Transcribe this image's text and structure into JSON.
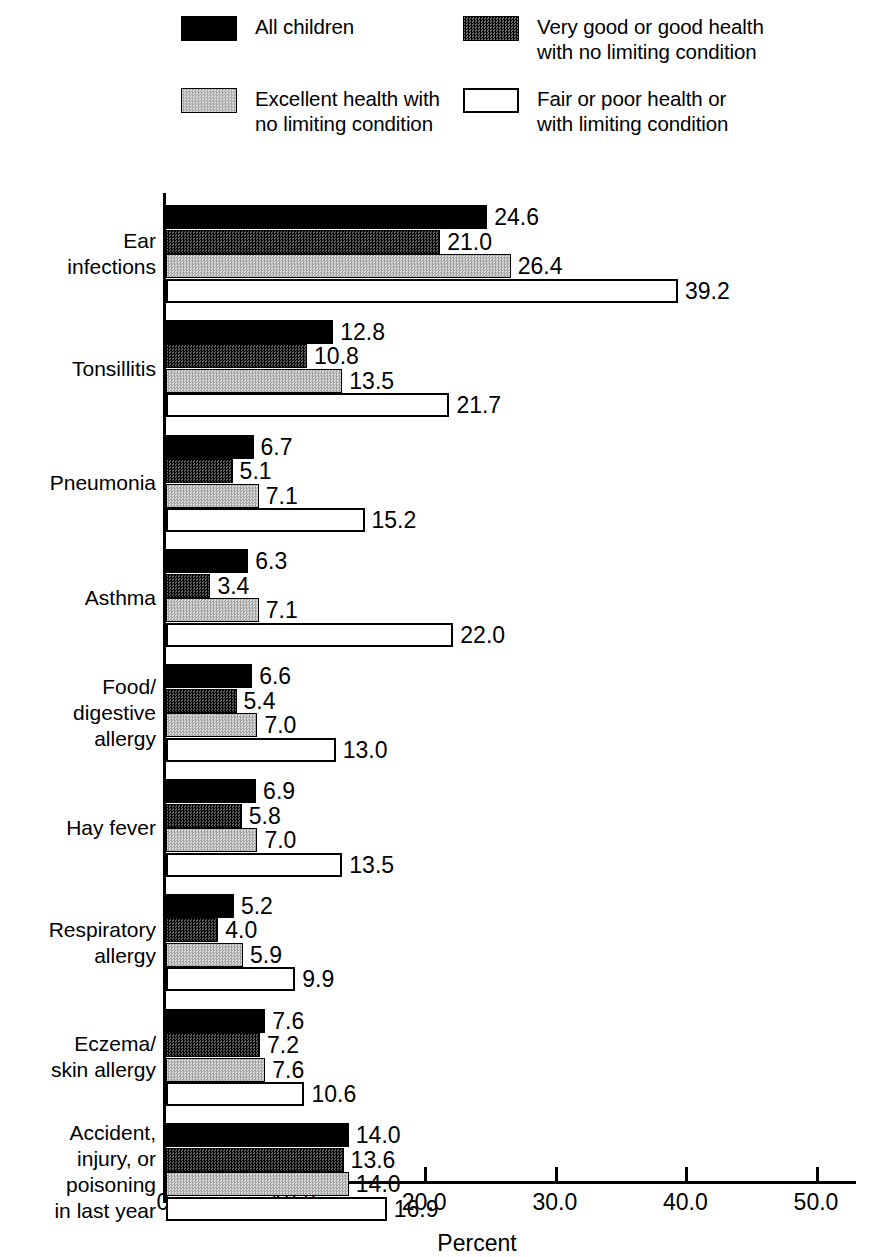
{
  "legend": {
    "items": [
      {
        "label": "All children",
        "swatch": "solid-black-swatch",
        "style": "sw-black",
        "col": "col1",
        "row": "row1"
      },
      {
        "label": "Very good or good health\nwith no limiting condition",
        "swatch": "dark-hatch-swatch",
        "style": "sw-dark",
        "col": "col2",
        "row": "row1"
      },
      {
        "label": "Excellent health with\nno limiting condition",
        "swatch": "light-hatch-swatch",
        "style": "sw-light",
        "col": "col1",
        "row": "row2"
      },
      {
        "label": "Fair or poor health or\nwith limiting condition",
        "swatch": "white-outline-swatch",
        "style": "sw-white",
        "col": "col2",
        "row": "row2"
      }
    ]
  },
  "axis": {
    "tick_labels": [
      "0",
      "10.0",
      "20.0",
      "30.0",
      "40.0",
      "50.0"
    ],
    "tick_values": [
      0,
      10,
      20,
      30,
      40,
      50
    ],
    "xlabel": "Percent"
  },
  "chart_data": {
    "type": "bar",
    "orientation": "horizontal",
    "title": "",
    "xlabel": "Percent",
    "ylabel": "",
    "xlim": [
      0,
      53
    ],
    "grid": false,
    "legend_position": "top",
    "categories": [
      "Ear\ninfections",
      "Tonsillitis",
      "Pneumonia",
      "Asthma",
      "Food/\ndigestive\nallergy",
      "Hay fever",
      "Respiratory\nallergy",
      "Eczema/\nskin allergy",
      "Accident,\ninjury, or\npoisoning\nin last year"
    ],
    "series": [
      {
        "name": "All children",
        "style": "b-black",
        "values": [
          24.6,
          12.8,
          6.7,
          6.3,
          6.6,
          6.9,
          5.2,
          7.6,
          14.0
        ],
        "labels": [
          "24.6",
          "12.8",
          "6.7",
          "6.3",
          "6.6",
          "6.9",
          "5.2",
          "7.6",
          "14.0"
        ]
      },
      {
        "name": "Very good or good health with no limiting condition",
        "style": "b-dark",
        "values": [
          21.0,
          10.8,
          5.1,
          3.4,
          5.4,
          5.8,
          4.0,
          7.2,
          13.6
        ],
        "labels": [
          "21.0",
          "10.8",
          "5.1",
          "3.4",
          "5.4",
          "5.8",
          "4.0",
          "7.2",
          "13.6"
        ]
      },
      {
        "name": "Excellent health with no limiting condition",
        "style": "b-light",
        "values": [
          26.4,
          13.5,
          7.1,
          7.1,
          7.0,
          7.0,
          5.9,
          7.6,
          14.0
        ],
        "labels": [
          "26.4",
          "13.5",
          "7.1",
          "7.1",
          "7.0",
          "7.0",
          "5.9",
          "7.6",
          "14.0"
        ]
      },
      {
        "name": "Fair or poor health or with limiting condition",
        "style": "b-white",
        "values": [
          39.2,
          21.7,
          15.2,
          22.0,
          13.0,
          13.5,
          9.9,
          10.6,
          16.9
        ],
        "labels": [
          "39.2",
          "21.7",
          "15.2",
          "22.0",
          "13.0",
          "13.5",
          "9.9",
          "10.6",
          "16.9"
        ]
      }
    ]
  }
}
